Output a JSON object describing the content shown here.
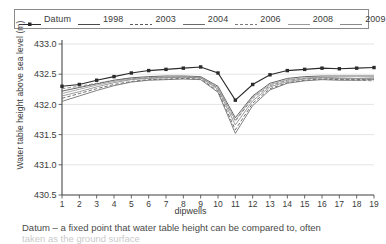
{
  "chart_data": {
    "type": "line",
    "title": "",
    "xlabel": "dipwells",
    "ylabel": "Water table height above sea level (m)",
    "categories": [
      "1",
      "2",
      "3",
      "4",
      "5",
      "6",
      "7",
      "8",
      "9",
      "10",
      "11",
      "12",
      "13",
      "14",
      "15",
      "16",
      "17",
      "18",
      "19"
    ],
    "xlim": [
      1,
      19
    ],
    "ylim": [
      430.5,
      433.0
    ],
    "yticks": [
      "430.5",
      "431.0",
      "431.5",
      "432.0",
      "432.5",
      "433.0"
    ],
    "grid": true,
    "legend_position": "top",
    "series": [
      {
        "name": "Datum",
        "color": "#2b2b2b",
        "style": "solid-marker",
        "values": [
          432.3,
          432.33,
          432.4,
          432.46,
          432.52,
          432.56,
          432.58,
          432.6,
          432.62,
          432.52,
          432.07,
          432.33,
          432.49,
          432.56,
          432.58,
          432.6,
          432.59,
          432.6,
          432.61
        ]
      },
      {
        "name": "1998",
        "color": "#4a4a4a",
        "style": "solid",
        "values": [
          432.22,
          432.28,
          432.34,
          432.4,
          432.44,
          432.46,
          432.47,
          432.47,
          432.46,
          432.3,
          431.78,
          432.14,
          432.35,
          432.43,
          432.46,
          432.47,
          432.47,
          432.47,
          432.47
        ]
      },
      {
        "name": "2003",
        "color": "#5a5a5a",
        "style": "dashed",
        "values": [
          432.1,
          432.18,
          432.26,
          432.33,
          432.38,
          432.41,
          432.42,
          432.43,
          432.42,
          432.22,
          431.58,
          432.02,
          432.26,
          432.36,
          432.4,
          432.42,
          432.41,
          432.41,
          432.42
        ]
      },
      {
        "name": "2004",
        "color": "#6a6a6a",
        "style": "solid",
        "values": [
          432.05,
          432.14,
          432.23,
          432.31,
          432.37,
          432.4,
          432.41,
          432.42,
          432.41,
          432.2,
          431.52,
          431.98,
          432.24,
          432.35,
          432.39,
          432.41,
          432.4,
          432.4,
          432.41
        ]
      },
      {
        "name": "2006",
        "color": "#7a7a7a",
        "style": "dashed",
        "values": [
          432.26,
          432.3,
          432.35,
          432.4,
          432.43,
          432.44,
          432.45,
          432.45,
          432.44,
          432.27,
          431.72,
          432.1,
          432.31,
          432.4,
          432.43,
          432.44,
          432.42,
          432.4,
          432.39
        ]
      },
      {
        "name": "2008",
        "color": "#9a9a9a",
        "style": "solid",
        "values": [
          432.18,
          432.25,
          432.32,
          432.38,
          432.42,
          432.44,
          432.45,
          432.46,
          432.45,
          432.28,
          431.74,
          432.12,
          432.33,
          432.41,
          432.44,
          432.45,
          432.44,
          432.43,
          432.43
        ]
      },
      {
        "name": "2009",
        "color": "#8a8a8a",
        "style": "solid",
        "values": [
          432.14,
          432.21,
          432.29,
          432.36,
          432.41,
          432.43,
          432.44,
          432.45,
          432.44,
          432.25,
          431.66,
          432.06,
          432.29,
          432.38,
          432.42,
          432.44,
          432.43,
          432.43,
          432.44
        ]
      }
    ]
  },
  "legend": {
    "entries": [
      {
        "label": "Datum"
      },
      {
        "label": "1998"
      },
      {
        "label": "2003"
      },
      {
        "label": "2004"
      },
      {
        "label": "2006"
      },
      {
        "label": "2008"
      },
      {
        "label": "2009"
      }
    ]
  },
  "caption": {
    "line1": "Datum – a fixed point that water table height can be compared to, often",
    "line2": "taken as the ground surface"
  }
}
